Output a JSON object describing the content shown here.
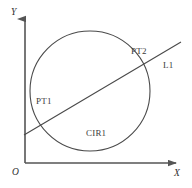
{
  "figure": {
    "background_color": "#ffffff",
    "stroke_color": "#4a4a4a",
    "axis_color": "#555555",
    "text_color": "#3b3b3b",
    "axes": {
      "y_label": "Y",
      "x_label": "X",
      "origin_label": "O",
      "origin_point": [
        25,
        163
      ],
      "y_axis_top": [
        25,
        14
      ],
      "x_axis_right": [
        181,
        163
      ]
    },
    "circle": {
      "label": "CIR1",
      "center": [
        90,
        91
      ],
      "radius": 60
    },
    "line": {
      "label": "L1",
      "start": [
        24,
        135
      ],
      "end": [
        181,
        42
      ]
    },
    "points": [
      {
        "label": "PT1",
        "at": [
          44,
          113
        ]
      },
      {
        "label": "PT2",
        "at": [
          142,
          62
        ]
      }
    ]
  }
}
